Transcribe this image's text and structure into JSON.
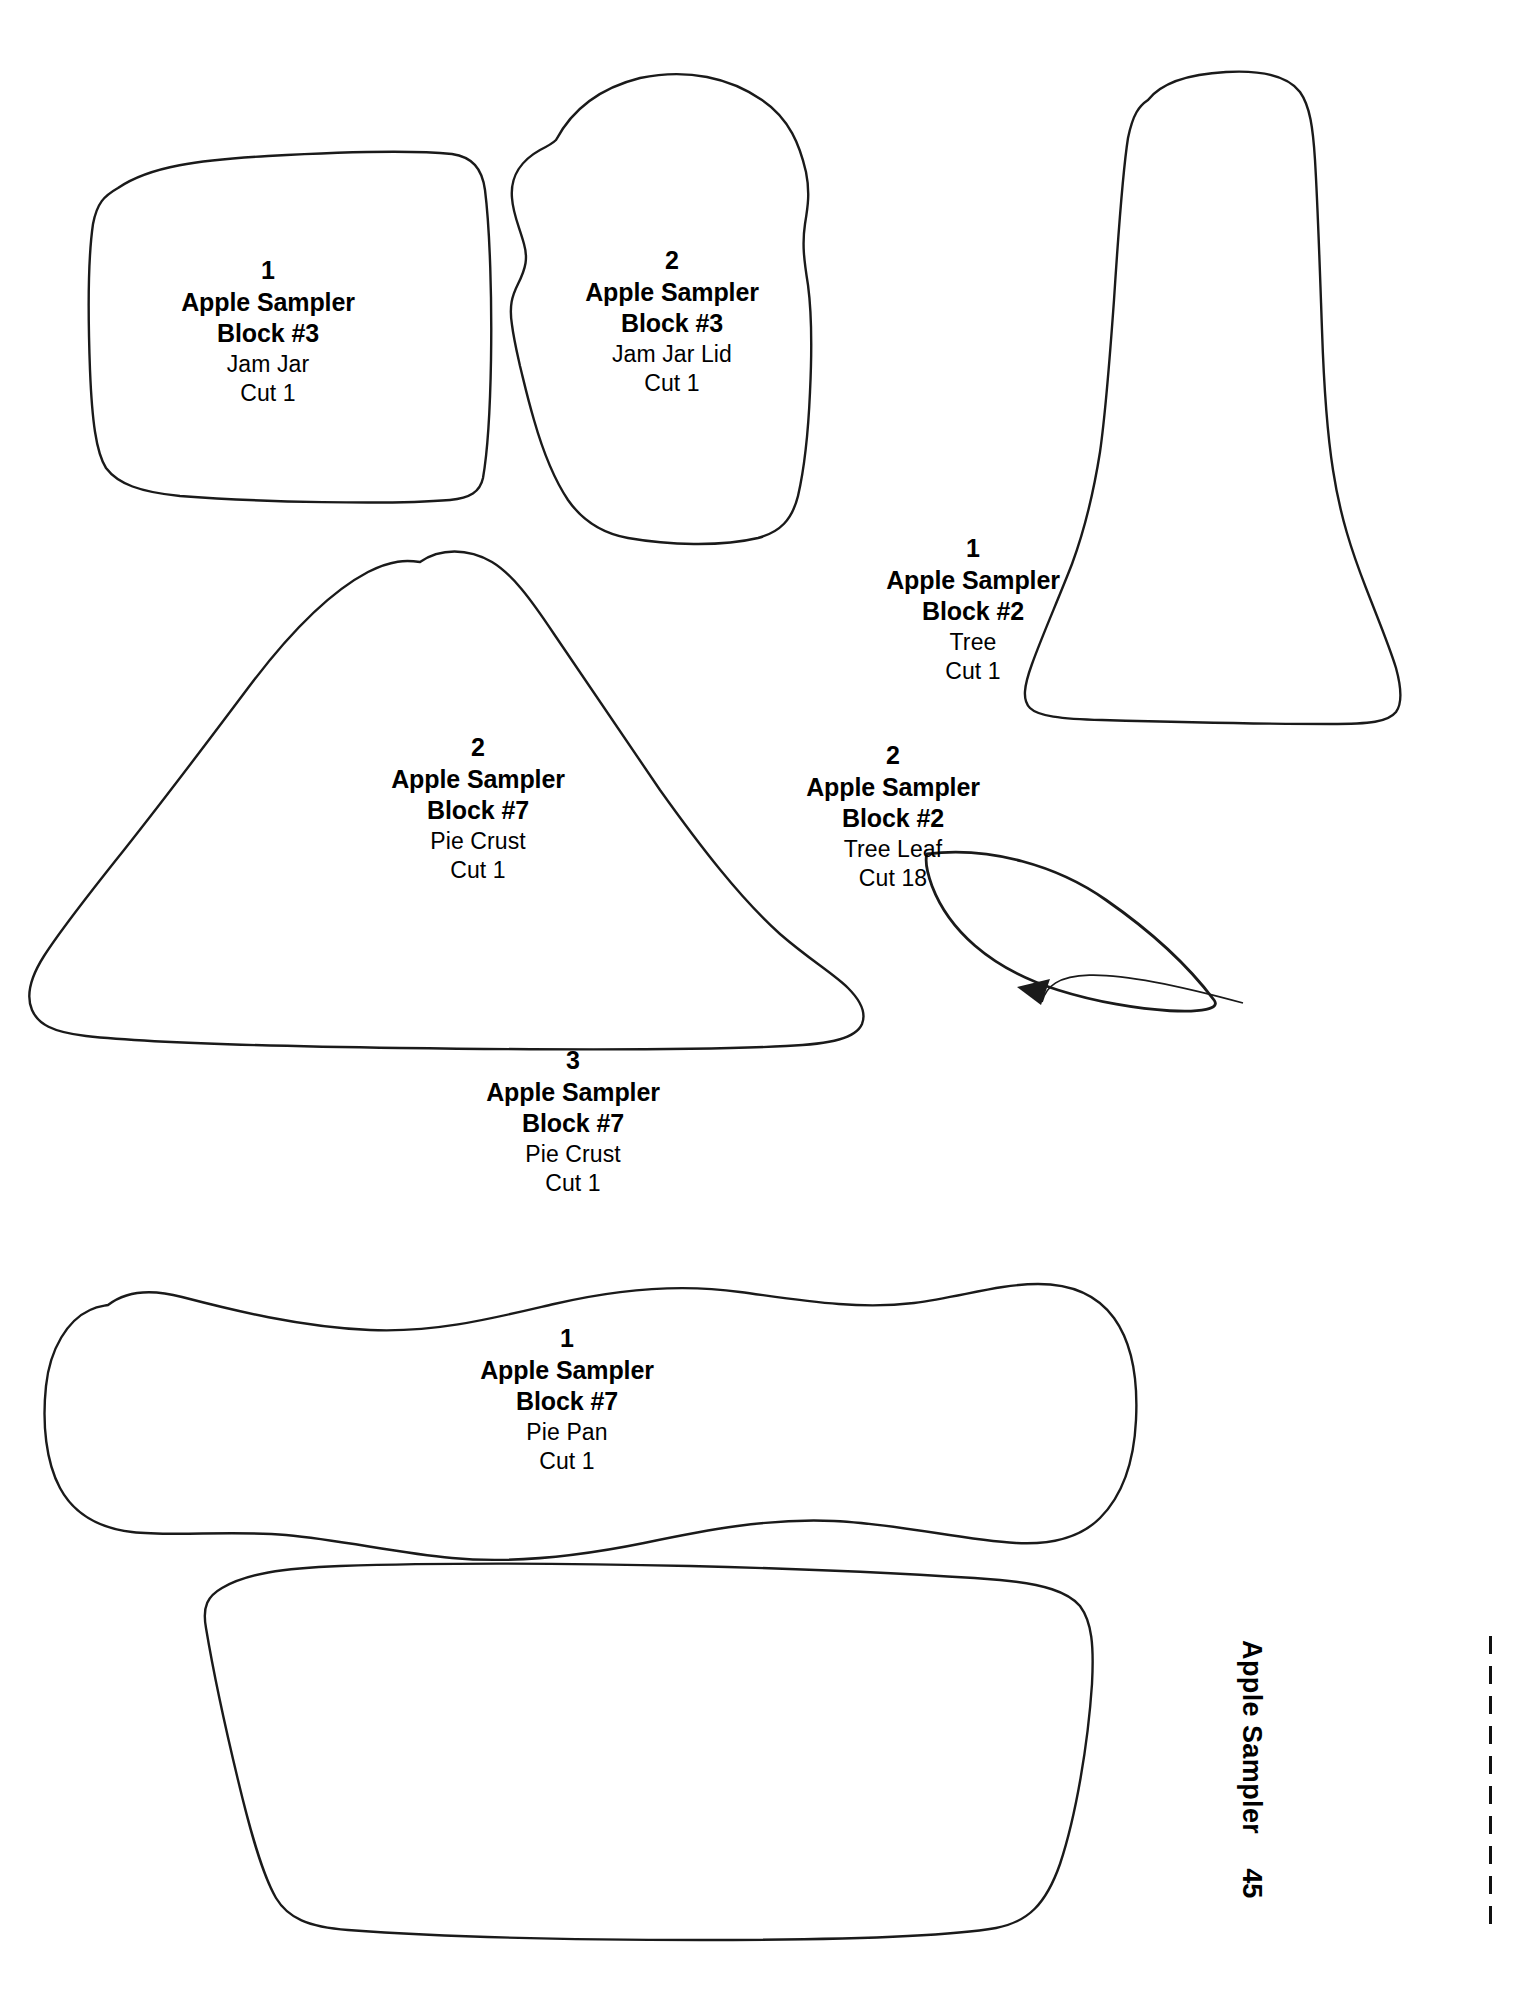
{
  "document": {
    "top_header": "",
    "side_footer_title": "Apple Sampler",
    "page_number": "45"
  },
  "pieces": [
    {
      "id": "jam-jar",
      "number": "1",
      "title": "Apple Sampler",
      "block": "Block #3",
      "part": "Jam Jar",
      "cut": "Cut 1",
      "label_x": 268,
      "label_y": 258
    },
    {
      "id": "jam-jar-lid",
      "number": "2",
      "title": "Apple Sampler",
      "block": "Block #3",
      "part": "Jam Jar Lid",
      "cut": "Cut 1",
      "label_x": 672,
      "label_y": 248
    },
    {
      "id": "tree",
      "number": "1",
      "title": "Apple Sampler",
      "block": "Block #2",
      "part": "Tree",
      "cut": "Cut 1",
      "label_x": 973,
      "label_y": 536
    },
    {
      "id": "pie-crust-2",
      "number": "2",
      "title": "Apple Sampler",
      "block": "Block #7",
      "part": "Pie Crust",
      "cut": "Cut 1",
      "label_x": 478,
      "label_y": 735
    },
    {
      "id": "tree-leaf",
      "number": "2",
      "title": "Apple Sampler",
      "block": "Block #2",
      "part": "Tree Leaf",
      "cut": "Cut 18",
      "label_x": 893,
      "label_y": 743
    },
    {
      "id": "pie-crust-3",
      "number": "3",
      "title": "Apple Sampler",
      "block": "Block #7",
      "part": "Pie Crust",
      "cut": "Cut 1",
      "label_x": 573,
      "label_y": 1048
    },
    {
      "id": "pie-pan",
      "number": "1",
      "title": "Apple Sampler",
      "block": "Block #7",
      "part": "Pie Pan",
      "cut": "Cut 1",
      "label_x": 567,
      "label_y": 1326
    }
  ],
  "colors": {
    "outline": "#1a1a1a",
    "background": "#ffffff"
  }
}
